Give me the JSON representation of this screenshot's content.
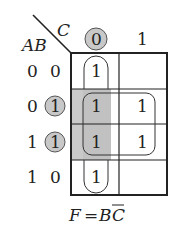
{
  "kmap": {
    "row_var_label": "AB",
    "col_var_label": "C",
    "col_headers": [
      "0",
      "1"
    ],
    "row_headers": [
      {
        "a": "0",
        "b": "0"
      },
      {
        "a": "0",
        "b": "1"
      },
      {
        "a": "1",
        "b": "1"
      },
      {
        "a": "1",
        "b": "0"
      }
    ],
    "cells": [
      [
        "1",
        ""
      ],
      [
        "1",
        "1"
      ],
      [
        "1",
        "1"
      ],
      [
        "1",
        ""
      ]
    ],
    "highlighted_col_header": "0",
    "highlighted_row_b_values": [
      "1",
      "1"
    ],
    "groups": [
      {
        "name": "C-bar column group",
        "cells": [
          [
            0,
            0
          ],
          [
            3,
            0
          ]
        ],
        "wraps": true
      },
      {
        "name": "B quad group",
        "cells": [
          [
            1,
            0
          ],
          [
            1,
            1
          ],
          [
            2,
            0
          ],
          [
            2,
            1
          ]
        ]
      }
    ],
    "shaded_region": "column C=0, rows AB=01 and 11"
  },
  "equation": {
    "lhs": "F",
    "eq": "=",
    "rhs_b": "B",
    "rhs_c": "C",
    "rhs_c_overbar": true
  },
  "colors": {
    "line": "#222222",
    "shade": "#c8c8c8",
    "circle_fill": "#c8c8c8"
  }
}
